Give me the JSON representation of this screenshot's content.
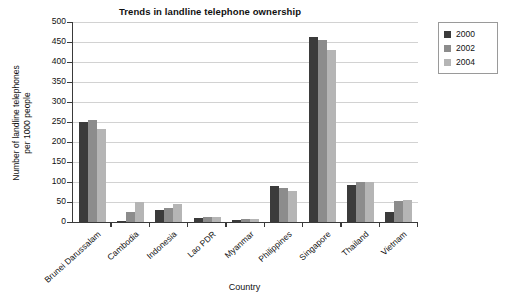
{
  "chart_data": {
    "type": "bar",
    "title": "Trends in landline telephone ownership",
    "xlabel": "Country",
    "ylabel": "Number of landline telephones per 1000 people",
    "ylabel_line1": "Number of landline telephones",
    "ylabel_line2": "per 1000 people",
    "ylim": [
      0,
      500
    ],
    "ytick_step": 50,
    "yticks": [
      0,
      50,
      100,
      150,
      200,
      250,
      300,
      350,
      400,
      450,
      500
    ],
    "ytick_labels": [
      "0",
      "50",
      "100",
      "150",
      "200",
      "250",
      "300",
      "350",
      "400",
      "450",
      "500"
    ],
    "grid": true,
    "legend_position": "right",
    "categories": [
      "Brunei Darussalam",
      "Cambodia",
      "Indonesia",
      "Lao PDR",
      "Myanmar",
      "Philippines",
      "Singapore",
      "Thailand",
      "Vietnam"
    ],
    "series": [
      {
        "name": "2000",
        "color": "#3b3b3b",
        "values": [
          250,
          3,
          31,
          9,
          6,
          90,
          462,
          92,
          26
        ]
      },
      {
        "name": "2002",
        "color": "#8c8c8c",
        "values": [
          255,
          25,
          36,
          12,
          7,
          86,
          455,
          99,
          52
        ]
      },
      {
        "name": "2004",
        "color": "#b5b5b5",
        "values": [
          232,
          50,
          46,
          13,
          8,
          78,
          430,
          100,
          56
        ]
      }
    ]
  },
  "legend": {
    "entries": [
      {
        "label": "2000",
        "color": "#3b3b3b"
      },
      {
        "label": "2002",
        "color": "#8c8c8c"
      },
      {
        "label": "2004",
        "color": "#b5b5b5"
      }
    ]
  }
}
